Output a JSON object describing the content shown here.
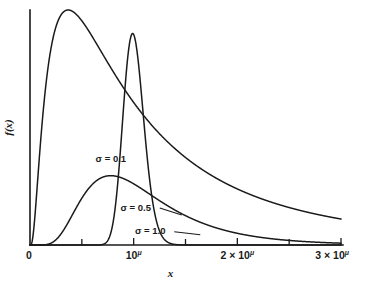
{
  "chart_data": {
    "type": "line",
    "title": "",
    "subtitle": "",
    "xlabel": "x",
    "ylabel": "f(x)",
    "xlim": [
      0,
      3
    ],
    "ylim": [
      0,
      1
    ],
    "grid": false,
    "legend_position": "inline-annotations",
    "distribution": "lognormal",
    "x_units": "multiples of 10^mu",
    "x_tick_values": [
      0,
      1,
      2,
      3
    ],
    "x_tick_labels": [
      "0",
      "10",
      "2 × 10",
      "3 × 10"
    ],
    "x_tick_superscripts": [
      "",
      "μ",
      "μ",
      "μ"
    ],
    "x_minor_tick_values": [
      0.5,
      1.5,
      2.5
    ],
    "y_ticks_shown": false,
    "series": [
      {
        "name": "σ = 0.1",
        "sigma": 0.1,
        "label": "σ = 0.1",
        "peak_x": 0.99,
        "peak_y": 0.9,
        "annotation_x": 0.78,
        "annotation_y": 0.355
      },
      {
        "name": "σ = 0.5",
        "sigma": 0.5,
        "label": "σ = 0.5",
        "peak_x": 0.27,
        "peak_y": 0.295,
        "annotation_x": 1.02,
        "annotation_y": 0.145
      },
      {
        "name": "σ = 1.0",
        "sigma": 1.0,
        "label": "σ = 1.0",
        "peak_x": 0.02,
        "peak_y": 1.0,
        "annotation_x": 1.16,
        "annotation_y": 0.048
      }
    ],
    "annotations": [
      {
        "text": "σ = 0.1",
        "x": 0.78,
        "y": 0.355
      },
      {
        "text": "σ = 0.5",
        "x": 1.02,
        "y": 0.145
      },
      {
        "text": "σ = 1.0",
        "x": 1.16,
        "y": 0.048
      }
    ],
    "colors": {
      "curve": "#1a1a1a",
      "axis": "#1a1a1a",
      "background": "#ffffff"
    }
  },
  "labels": {
    "x_axis_title": "x",
    "y_axis_title": "f(x)",
    "origin": "0"
  }
}
